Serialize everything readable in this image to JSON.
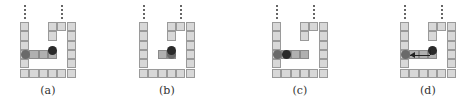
{
  "figure": {
    "panels": [
      {
        "id": "a",
        "label": "(a)",
        "left": 20,
        "gray_ball": [
          0,
          3
        ],
        "black_ball": [
          3,
          2.5
        ],
        "shaded_row": [
          0,
          1,
          2,
          3
        ],
        "lifted": false,
        "arrow": false
      },
      {
        "id": "b",
        "label": "(b)",
        "left": 139,
        "gray_ball": [
          3,
          3
        ],
        "black_ball": [
          3,
          2.5
        ],
        "shaded_row": [
          2,
          3
        ],
        "lifted": false,
        "arrow": false
      },
      {
        "id": "c",
        "label": "(c)",
        "left": 272,
        "gray_ball": [
          0,
          3
        ],
        "black_ball": [
          1,
          3
        ],
        "shaded_row": [
          0,
          1,
          2,
          3
        ],
        "lifted": false,
        "arrow": false
      },
      {
        "id": "d",
        "label": "(d)",
        "left": 400,
        "gray_ball": [
          0,
          3
        ],
        "black_ball": [
          3,
          2.5
        ],
        "shaded_row": [
          0,
          1,
          2,
          3
        ],
        "lifted": false,
        "arrow": true
      }
    ],
    "colors": {
      "cell": "#d8d8d8",
      "cell_border": "#9a9a9a",
      "gray_ball": "#6a6a6a",
      "black_ball": "#2a2a2a"
    }
  }
}
